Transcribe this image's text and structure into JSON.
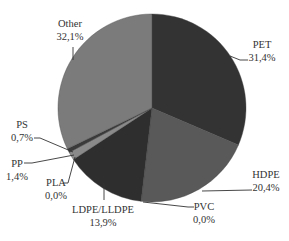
{
  "chart_data": {
    "type": "pie",
    "title": "",
    "start_angle_deg": 0,
    "direction": "clockwise",
    "slices": [
      {
        "label": "PET",
        "value": 31.4,
        "display": "31,4%",
        "color": "#333333"
      },
      {
        "label": "HDPE",
        "value": 20.4,
        "display": "20,4%",
        "color": "#595959"
      },
      {
        "label": "PVC",
        "value": 0.0,
        "display": "0,0%",
        "color": "#6a6a6a"
      },
      {
        "label": "LDPE/LLDPE",
        "value": 13.9,
        "display": "13,9%",
        "color": "#2e2e2e"
      },
      {
        "label": "PLA",
        "value": 0.0,
        "display": "0,0%",
        "color": "#4a4a4a"
      },
      {
        "label": "PP",
        "value": 1.4,
        "display": "1,4%",
        "color": "#8a8a8a"
      },
      {
        "label": "PS",
        "value": 0.7,
        "display": "0,7%",
        "color": "#3a3a3a"
      },
      {
        "label": "Other",
        "value": 32.1,
        "display": "32,1%",
        "color": "#7b7b7b"
      }
    ],
    "legend": "none (leader-line labels)"
  },
  "labels": {
    "pet": {
      "name": "PET",
      "pct": "31,4%"
    },
    "hdpe": {
      "name": "HDPE",
      "pct": "20,4%"
    },
    "pvc": {
      "name": "PVC",
      "pct": "0,0%"
    },
    "ldpe": {
      "name": "LDPE/LLDPE",
      "pct": "13,9%"
    },
    "pla": {
      "name": "PLA",
      "pct": "0,0%"
    },
    "pp": {
      "name": "PP",
      "pct": "1,4%"
    },
    "ps": {
      "name": "PS",
      "pct": "0,7%"
    },
    "other": {
      "name": "Other",
      "pct": "32,1%"
    }
  }
}
